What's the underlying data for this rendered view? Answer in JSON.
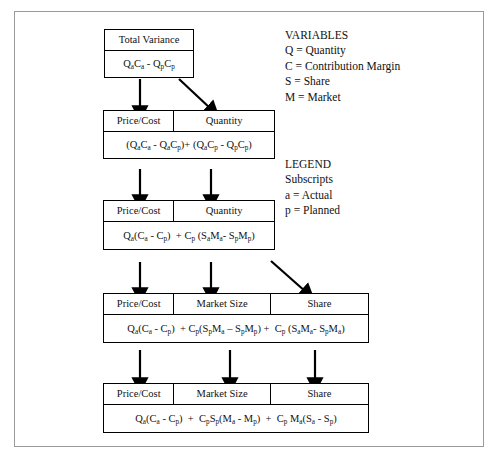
{
  "diagram": {
    "title_implicit": "Variance Decomposition Tree",
    "boxes": [
      {
        "id": "total-variance",
        "headers": [
          "Total Variance"
        ],
        "formula_html": "Q<sub>a</sub>C<sub>a</sub> - Q<sub>p</sub>C<sub>p</sub>",
        "formula_text": "QaCa - QpCp"
      },
      {
        "id": "level-2",
        "headers": [
          "Price/Cost",
          "Quantity"
        ],
        "formula_html": "(Q<sub>a</sub>C<sub>a</sub> - Q<sub>a</sub>C<sub>p</sub>)+ (Q<sub>a</sub>C<sub>p</sub> - Q<sub>p</sub>C<sub>p</sub>)",
        "formula_text": "(QaCa - QaCp)+ (QaCp - QpCp)"
      },
      {
        "id": "level-3",
        "headers": [
          "Price/Cost",
          "Quantity"
        ],
        "formula_html": "Q<sub>a</sub>(C<sub>a</sub> - C<sub>p</sub>)&nbsp; + C<sub>p</sub> (S<sub>a</sub>M<sub>a</sub>- S<sub>p</sub>M<sub>p</sub>)",
        "formula_text": "Qa(Ca - Cp) + Cp (SaMa- SpMp)"
      },
      {
        "id": "level-4",
        "headers": [
          "Price/Cost",
          "Market Size",
          "Share"
        ],
        "formula_html": "Q<sub>a</sub>(C<sub>a</sub> - C<sub>p</sub>)&nbsp; + C<sub>p</sub>(S<sub>p</sub>M<sub>a</sub> &ndash; S<sub>p</sub>M<sub>p</sub>) +&nbsp; C<sub>p</sub> (S<sub>a</sub>M<sub>a</sub>- S<sub>p</sub>M<sub>a</sub>)",
        "formula_text": "Qa(Ca - Cp) + Cp(SpMa - SpMp) + Cp (SaMa- SpMa)"
      },
      {
        "id": "level-5",
        "headers": [
          "Price/Cost",
          "Market Size",
          "Share"
        ],
        "formula_html": "Q<sub>a</sub>(C<sub>a</sub> - C<sub>p</sub>)&nbsp; +&nbsp; C<sub>p</sub>S<sub>p</sub>(M<sub>a</sub> - M<sub>p</sub>)&nbsp; +&nbsp; C<sub>p</sub> M<sub>a</sub>(S<sub>a</sub> - S<sub>p</sub>)",
        "formula_text": "Qa(Ca - Cp) + CpSp(Ma - Mp) + Cp Ma(Sa - Sp)"
      }
    ],
    "variables": {
      "heading": "VARIABLES",
      "items": [
        "Q = Quantity",
        "C = Contribution Margin",
        "S = Share",
        "M = Market"
      ]
    },
    "legend": {
      "heading": "LEGEND",
      "subheading": "Subscripts",
      "items": [
        "a = Actual",
        "p = Planned"
      ]
    },
    "colors": {
      "line": "#000000",
      "frame": "#9a9a9a",
      "background": "#ffffff"
    }
  }
}
